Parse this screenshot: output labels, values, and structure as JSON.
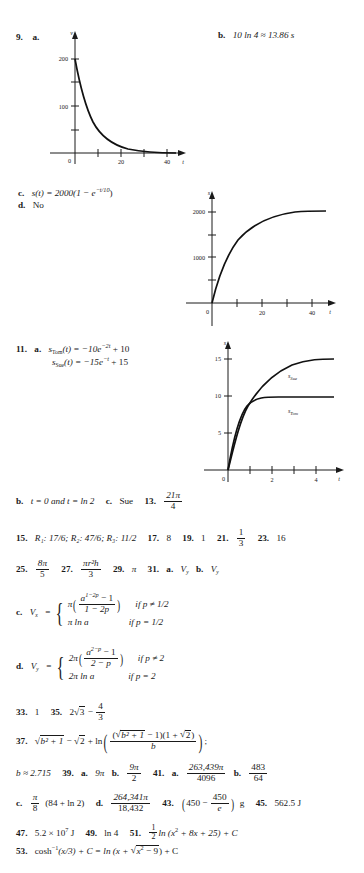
{
  "page": {
    "type": "textbook-answer-key",
    "font_color": "#1a1a1a",
    "background": "#ffffff"
  },
  "entries": {
    "e9_label": "9.",
    "e9_a": "a.",
    "e9_b_label": "b.",
    "e9_b_text": "10 ln 4  ≈  13.86 s",
    "e9_c_label": "c.",
    "e9_c_text_pre": "s(t)  =  2000(1  −  e",
    "e9_c_exp": "−t/10",
    "e9_c_text_post": ")",
    "e9_d_label": "d.",
    "e9_d_text": "No",
    "e11_label": "11.",
    "e11_a": "a.",
    "e11_a_line1_fn": "s",
    "e11_a_line1_sub": "Tom",
    "e11_a_line1_rest": "(t)  =  −10e",
    "e11_a_line1_exp": "−2t",
    "e11_a_line1_tail": "  +  10",
    "e11_a_line2_fn": "s",
    "e11_a_line2_sub": "Sue",
    "e11_a_line2_rest": "(t)  =  −15e",
    "e11_a_line2_exp": "−t",
    "e11_a_line2_tail": "  +  15",
    "e11_b_label": "b.",
    "e11_b_text": "t = 0 and t =  ln 2",
    "e11_c_label": "c.",
    "e11_c_text": "Sue",
    "e13_label": "13.",
    "e13_num": "21π",
    "e13_den": "4",
    "e15_label": "15.",
    "e15_text": "R₁: 17/6; R₂: 47/6; R₃: 11/2",
    "e17_label": "17.",
    "e17_text": "8",
    "e19_label": "19.",
    "e19_text": "1",
    "e21_label": "21.",
    "e21_num": "1",
    "e21_den": "3",
    "e23_label": "23.",
    "e23_text": "16",
    "e25_label": "25.",
    "e25_num": "8π",
    "e25_den": "5",
    "e27_label": "27.",
    "e27_num": "πr²h",
    "e27_den": "3",
    "e29_label": "29.",
    "e29_text": "π",
    "e31_label": "31.",
    "e31_a_label": "a.",
    "e31_a_text": "V",
    "e31_a_sub": "y",
    "e31_b_label": "b.",
    "e31_b_text": "V",
    "e31_b_sub": "y",
    "e31_c_label": "c.",
    "e31_c_lhs": "V",
    "e31_c_lhs_sub": "x",
    "e31_c_eq": "=",
    "e31_c_row1_pi": "π",
    "e31_c_row1_num_pre": "a",
    "e31_c_row1_num_exp": "1−2p",
    "e31_c_row1_num_post": " − 1",
    "e31_c_row1_den": "1 − 2p",
    "e31_c_row1_cond": "if p ≠ 1/2",
    "e31_c_row2": "π ln a",
    "e31_c_row2_cond": "if p = 1/2",
    "e31_d_label": "d.",
    "e31_d_lhs": "V",
    "e31_d_lhs_sub": "y",
    "e31_d_eq": "=",
    "e31_d_row1_pi": "2π",
    "e31_d_row1_num_pre": "a",
    "e31_d_row1_num_exp": "2−p",
    "e31_d_row1_num_post": " − 1",
    "e31_d_row1_den": "2 − p",
    "e31_d_row1_cond": "if p ≠ 2",
    "e31_d_row2": "2π ln a",
    "e31_d_row2_cond": "if p = 2",
    "e33_label": "33.",
    "e33_text": "1",
    "e35_label": "35.",
    "e35_pre": "2",
    "e35_rad": "3",
    "e35_minus": " − ",
    "e35_num": "4",
    "e35_den": "3",
    "e37_label": "37.",
    "e37_rad1": "b² + 1",
    "e37_mid": " − ",
    "e37_rad2": "2",
    "e37_plus_ln": " + ln",
    "e37_num_p1": "(",
    "e37_num_rad": "b² + 1",
    "e37_num_p2": " − 1)(1 + ",
    "e37_num_rad2": "2",
    "e37_num_p3": ")",
    "e37_den": "b",
    "e37_semicolon": ";",
    "e37_b_text": "b ≈ 2.715",
    "e39_label": "39.",
    "e39_a_label": "a.",
    "e39_a_text": "9π",
    "e39_b_label": "b.",
    "e39_b_num": "9π",
    "e39_b_den": "2",
    "e41_label": "41.",
    "e41_a_label": "a.",
    "e41_a_num": "263,439π",
    "e41_a_den": "4096",
    "e41_b_label": "b.",
    "e41_b_num": "483",
    "e41_b_den": "64",
    "e41_c_label": "c.",
    "e41_c_num": "π",
    "e41_c_den": "8",
    "e41_c_rest": "(84 + ln 2)",
    "e41_d_label": "d.",
    "e41_d_num": "264,341π",
    "e41_d_den": "18,432",
    "e43_label": "43.",
    "e43_pre": "450 − ",
    "e43_num": "450",
    "e43_den": "e",
    "e43_unit": "g",
    "e45_label": "45.",
    "e45_text": "562.5 J",
    "e47_label": "47.",
    "e47_pre": "5.2 × 10",
    "e47_exp": "7",
    "e47_post": " J",
    "e49_label": "49.",
    "e49_text": "ln 4",
    "e51_label": "51.",
    "e51_num": "1",
    "e51_den": "2",
    "e51_rest_pre": "ln (x",
    "e51_exp": "2",
    "e51_rest_post": " + 8x + 25) + C",
    "e53_label": "53.",
    "e53_pre": "cosh",
    "e53_exp": "−1",
    "e53_mid": "(x/3) + C = ln (x + ",
    "e53_rad_pre": "x",
    "e53_rad_exp": "2",
    "e53_rad_post": " − 9",
    "e53_tail": ") + C"
  },
  "graphs": [
    {
      "id": "graph-9a",
      "name": "velocity-decay-graph",
      "type": "line",
      "title": "",
      "xlabel": "t",
      "ylabel": "v",
      "xticks": [
        20,
        40
      ],
      "xtick_labels": [
        "20",
        "40"
      ],
      "yticks": [
        100,
        200
      ],
      "ytick_labels": [
        "100",
        "200"
      ],
      "origin_label": "0",
      "xlim": [
        0,
        50
      ],
      "ylim": [
        0,
        250
      ],
      "series": [
        {
          "name": "v(t) = 200e^(-t/10)",
          "x": [
            0,
            2,
            4,
            6,
            8,
            10,
            14,
            18,
            22,
            26,
            30,
            35,
            40,
            45
          ],
          "y": [
            200,
            164,
            134,
            110,
            90,
            74,
            49,
            33,
            22,
            15,
            10,
            6,
            3.7,
            2.2
          ]
        }
      ]
    },
    {
      "id": "graph-9c",
      "name": "position-saturation-graph",
      "type": "line",
      "title": "",
      "xlabel": "t",
      "ylabel": "s",
      "xticks": [
        20,
        40
      ],
      "xtick_labels": [
        "20",
        "40"
      ],
      "yticks": [
        1000,
        2000
      ],
      "ytick_labels": [
        "1000",
        "2000"
      ],
      "origin_label": "0",
      "xlim": [
        0,
        50
      ],
      "ylim": [
        0,
        2400
      ],
      "series": [
        {
          "name": "s(t) = 2000(1 - e^(-t/10))",
          "x": [
            0,
            2,
            4,
            6,
            8,
            10,
            14,
            18,
            22,
            26,
            30,
            35,
            40,
            45
          ],
          "y": [
            0,
            363,
            659,
            902,
            1101,
            1264,
            1507,
            1669,
            1778,
            1851,
            1900,
            1939,
            1963,
            1978
          ]
        }
      ]
    },
    {
      "id": "graph-11a",
      "name": "tom-sue-position-graph",
      "type": "line",
      "title": "",
      "xlabel": "t",
      "ylabel": "s",
      "xticks": [
        2,
        4
      ],
      "xtick_labels": [
        "2",
        "4"
      ],
      "yticks": [
        5,
        10,
        15
      ],
      "ytick_labels": [
        "5",
        "10",
        "15"
      ],
      "origin_label": "0",
      "xlim": [
        0,
        5
      ],
      "ylim": [
        0,
        17
      ],
      "series": [
        {
          "name": "s_Sue",
          "label": "s",
          "label_sub": "Sue",
          "x": [
            0,
            0.25,
            0.5,
            0.75,
            1,
            1.5,
            2,
            2.5,
            3,
            3.5,
            4,
            4.5,
            5
          ],
          "y": [
            0,
            3.32,
            5.9,
            7.91,
            9.48,
            11.65,
            12.97,
            13.77,
            14.25,
            14.55,
            14.73,
            14.83,
            14.9
          ]
        },
        {
          "name": "s_Tom",
          "label": "s",
          "label_sub": "Tom",
          "x": [
            0,
            0.25,
            0.5,
            0.75,
            1,
            1.5,
            2,
            2.5,
            3,
            3.5,
            4,
            4.5,
            5
          ],
          "y": [
            0,
            3.93,
            6.32,
            7.77,
            8.65,
            9.5,
            9.82,
            9.93,
            9.98,
            9.99,
            10,
            10,
            10
          ]
        }
      ]
    }
  ]
}
